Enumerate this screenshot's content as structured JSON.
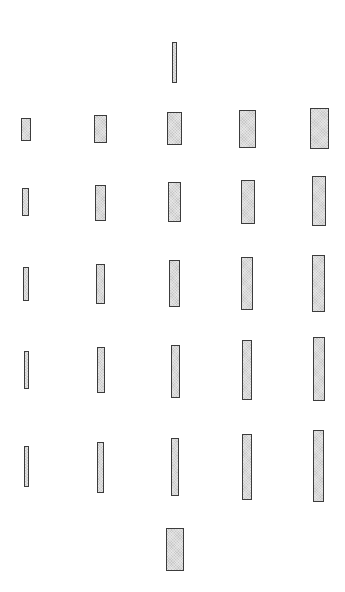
{
  "figure": {
    "fill_color": "#d9d9d9",
    "border_color": "#3c3c3c",
    "standard_top": {
      "x": 172,
      "y": 42,
      "w": 5,
      "h": 41
    },
    "standard_bottom": {
      "x": 166,
      "y": 528,
      "w": 18,
      "h": 43
    },
    "rows": [
      {
        "row": 1,
        "rects": [
          {
            "x": 21,
            "y": 118,
            "w": 10,
            "h": 23
          },
          {
            "x": 94,
            "y": 115,
            "w": 13,
            "h": 28
          },
          {
            "x": 167,
            "y": 112,
            "w": 15,
            "h": 33
          },
          {
            "x": 239,
            "y": 110,
            "w": 17,
            "h": 38
          },
          {
            "x": 310,
            "y": 108,
            "w": 19,
            "h": 41
          }
        ]
      },
      {
        "row": 2,
        "rects": [
          {
            "x": 22,
            "y": 188,
            "w": 7,
            "h": 28
          },
          {
            "x": 95,
            "y": 185,
            "w": 11,
            "h": 36
          },
          {
            "x": 168,
            "y": 182,
            "w": 13,
            "h": 40
          },
          {
            "x": 241,
            "y": 180,
            "w": 14,
            "h": 44
          },
          {
            "x": 312,
            "y": 176,
            "w": 14,
            "h": 50
          }
        ]
      },
      {
        "row": 3,
        "rects": [
          {
            "x": 23,
            "y": 267,
            "w": 6,
            "h": 34
          },
          {
            "x": 96,
            "y": 264,
            "w": 9,
            "h": 40
          },
          {
            "x": 169,
            "y": 260,
            "w": 11,
            "h": 47
          },
          {
            "x": 241,
            "y": 257,
            "w": 12,
            "h": 53
          },
          {
            "x": 312,
            "y": 255,
            "w": 13,
            "h": 57
          }
        ]
      },
      {
        "row": 4,
        "rects": [
          {
            "x": 24,
            "y": 351,
            "w": 5,
            "h": 38
          },
          {
            "x": 97,
            "y": 347,
            "w": 8,
            "h": 46
          },
          {
            "x": 171,
            "y": 345,
            "w": 9,
            "h": 53
          },
          {
            "x": 242,
            "y": 340,
            "w": 10,
            "h": 60
          },
          {
            "x": 313,
            "y": 337,
            "w": 12,
            "h": 64
          }
        ]
      },
      {
        "row": 5,
        "rects": [
          {
            "x": 24,
            "y": 446,
            "w": 5,
            "h": 41
          },
          {
            "x": 97,
            "y": 442,
            "w": 7,
            "h": 51
          },
          {
            "x": 171,
            "y": 438,
            "w": 8,
            "h": 58
          },
          {
            "x": 242,
            "y": 434,
            "w": 10,
            "h": 66
          },
          {
            "x": 313,
            "y": 430,
            "w": 11,
            "h": 72
          }
        ]
      }
    ]
  }
}
